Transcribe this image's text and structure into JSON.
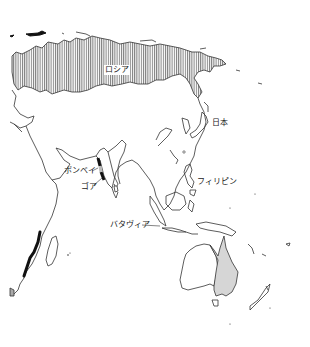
{
  "map": {
    "title": "",
    "labels": {
      "russia": "ロシア",
      "japan": "日本",
      "philippines": "フィリピン",
      "bombay": "ボンベイ",
      "goa": "ゴア",
      "batavia": "バタヴィア"
    },
    "colors": {
      "background": "#ffffff",
      "coastline": "#333333",
      "russia_hatch": "#7a7a7a",
      "australia_east_fill": "#d6d6d6",
      "highlight_dark": "#111111"
    },
    "legend_regions": [
      {
        "name": "Russia",
        "style": "vertical-hatch"
      },
      {
        "name": "Eastern Australia",
        "style": "light-gray-fill"
      },
      {
        "name": "Indian west coast (Bombay–Goa)",
        "style": "black-segments"
      },
      {
        "name": "Southeast African coast",
        "style": "black-line"
      }
    ]
  }
}
